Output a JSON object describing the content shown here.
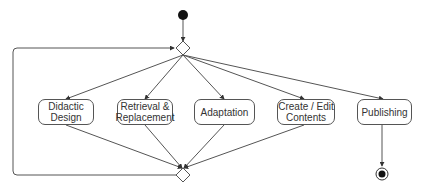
{
  "diagram": {
    "type": "uml-activity",
    "colors": {
      "line": "#555555",
      "fill": "#ffffff",
      "text": "#333333",
      "dot": "#111111"
    },
    "activities": [
      {
        "id": "didactic",
        "label": "Didactic\nDesign"
      },
      {
        "id": "retrieval",
        "label": "Retrieval &\nReplacement"
      },
      {
        "id": "adaptation",
        "label": "Adaptation"
      },
      {
        "id": "create",
        "label": "Create / Edit\nContents"
      },
      {
        "id": "publishing",
        "label": "Publishing"
      }
    ],
    "nodes": {
      "start": "initial-node",
      "decision": "decision-node",
      "merge": "merge-node",
      "end": "final-node"
    }
  }
}
